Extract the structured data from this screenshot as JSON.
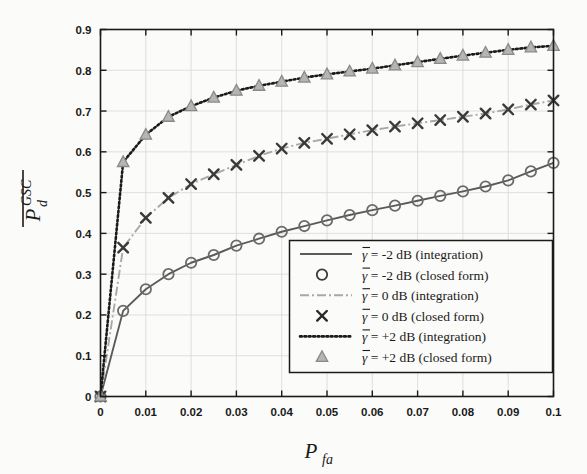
{
  "chart_data": {
    "type": "line",
    "title": "",
    "xlabel": "P_fa",
    "ylabel": "P̄_d^GSC",
    "xlim": [
      0,
      0.1
    ],
    "ylim": [
      0,
      0.9
    ],
    "grid": true,
    "legend_position": "lower-right",
    "x_ticks": [
      "0",
      "0.01",
      "0.02",
      "0.03",
      "0.04",
      "0.05",
      "0.06",
      "0.07",
      "0.08",
      "0.09",
      "0.1"
    ],
    "x_tick_values": [
      0,
      0.01,
      0.02,
      0.03,
      0.04,
      0.05,
      0.06,
      0.07,
      0.08,
      0.09,
      0.1
    ],
    "y_ticks": [
      "0",
      "0.1",
      "0.2",
      "0.3",
      "0.4",
      "0.5",
      "0.6",
      "0.7",
      "0.8",
      "0.9"
    ],
    "y_tick_values": [
      0,
      0.1,
      0.2,
      0.3,
      0.4,
      0.5,
      0.6,
      0.7,
      0.8,
      0.9
    ],
    "x": [
      0,
      0.005,
      0.01,
      0.015,
      0.02,
      0.025,
      0.03,
      0.035,
      0.04,
      0.045,
      0.05,
      0.055,
      0.06,
      0.065,
      0.07,
      0.075,
      0.08,
      0.085,
      0.09,
      0.095,
      0.1
    ],
    "series": [
      {
        "name": "gamma = -2 dB (integration)",
        "style": "solid",
        "color": "#5a5a5a",
        "marker": "none",
        "values": [
          0,
          0.21,
          0.263,
          0.3,
          0.328,
          0.347,
          0.37,
          0.387,
          0.404,
          0.418,
          0.432,
          0.445,
          0.457,
          0.468,
          0.48,
          0.492,
          0.503,
          0.515,
          0.53,
          0.552,
          0.573
        ]
      },
      {
        "name": "gamma = -2 dB (closed form)",
        "style": "none",
        "color": "#6a6a6a",
        "marker": "circle",
        "values": [
          0,
          0.21,
          0.263,
          0.3,
          0.328,
          0.347,
          0.37,
          0.387,
          0.404,
          0.418,
          0.432,
          0.445,
          0.457,
          0.468,
          0.48,
          0.492,
          0.503,
          0.515,
          0.53,
          0.552,
          0.573
        ]
      },
      {
        "name": "gamma = 0 dB (integration)",
        "style": "dashdot",
        "color": "#a8a8a8",
        "marker": "none",
        "values": [
          0,
          0.365,
          0.438,
          0.487,
          0.521,
          0.545,
          0.568,
          0.59,
          0.608,
          0.622,
          0.632,
          0.643,
          0.653,
          0.662,
          0.67,
          0.678,
          0.686,
          0.694,
          0.704,
          0.716,
          0.726
        ]
      },
      {
        "name": "gamma = 0 dB (closed form)",
        "style": "none",
        "color": "#3a3a3a",
        "marker": "cross",
        "values": [
          0,
          0.365,
          0.438,
          0.487,
          0.521,
          0.545,
          0.568,
          0.59,
          0.608,
          0.622,
          0.632,
          0.643,
          0.653,
          0.662,
          0.67,
          0.678,
          0.686,
          0.694,
          0.704,
          0.716,
          0.726
        ]
      },
      {
        "name": "gamma = +2 dB (integration)",
        "style": "dotted",
        "color": "#1a1a1a",
        "marker": "none",
        "values": [
          0,
          0.575,
          0.642,
          0.686,
          0.712,
          0.733,
          0.75,
          0.762,
          0.772,
          0.782,
          0.79,
          0.797,
          0.804,
          0.812,
          0.82,
          0.828,
          0.836,
          0.843,
          0.85,
          0.856,
          0.86
        ]
      },
      {
        "name": "gamma = +2 dB (closed form)",
        "style": "none",
        "color": "#9a9a9a",
        "marker": "triangle",
        "values": [
          0,
          0.575,
          0.642,
          0.686,
          0.712,
          0.733,
          0.75,
          0.762,
          0.772,
          0.782,
          0.79,
          0.797,
          0.804,
          0.812,
          0.82,
          0.828,
          0.836,
          0.843,
          0.85,
          0.856,
          0.86
        ]
      }
    ]
  },
  "legend": {
    "entries": [
      {
        "sample": "line-solid",
        "prefix": "γ",
        "eq": " = ",
        "value": "-2 dB",
        "suffix": " (integration)"
      },
      {
        "sample": "marker-circle",
        "prefix": "γ",
        "eq": " = ",
        "value": "-2 dB",
        "suffix": " (closed form)"
      },
      {
        "sample": "line-dashdot",
        "prefix": "γ",
        "eq": " = ",
        "value": "0 dB",
        "suffix": " (integration)"
      },
      {
        "sample": "marker-cross",
        "prefix": "γ",
        "eq": " = ",
        "value": "0 dB",
        "suffix": " (closed form)"
      },
      {
        "sample": "line-dotted",
        "prefix": "γ",
        "eq": " = ",
        "value": "+2 dB",
        "suffix": " (integration)"
      },
      {
        "sample": "marker-triangle",
        "prefix": "γ",
        "eq": " = ",
        "value": "+2 dB",
        "suffix": " (closed form)"
      }
    ]
  },
  "axes": {
    "x_title_main": "P",
    "x_title_sub": "fa",
    "y_title_main": "P",
    "y_title_sub": "d",
    "y_title_sup": "GSC"
  },
  "colors": {
    "background": "#fbfbf9",
    "axis": "#1a1a1a",
    "grid": "#d8d8d6",
    "series_low": "#5a5a5a",
    "series_mid": "#a8a8a8",
    "series_high": "#1a1a1a"
  }
}
